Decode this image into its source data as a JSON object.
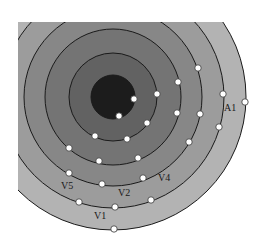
{
  "diagram": {
    "type": "concentric-rings",
    "center": {
      "x": 113,
      "y": 97
    },
    "clip": {
      "left": 18,
      "top": 22
    },
    "rings": [
      {
        "radius": 133,
        "color": "#b3b3b3"
      },
      {
        "radius": 111,
        "color": "#9c9c9c"
      },
      {
        "radius": 89,
        "color": "#878787"
      },
      {
        "radius": 68,
        "color": "#747474"
      },
      {
        "radius": 44,
        "color": "#626262"
      },
      {
        "radius": 22,
        "color": "#1c1c1c"
      }
    ],
    "nodes": [
      {
        "x": 134,
        "y": 99
      },
      {
        "x": 119,
        "y": 116
      },
      {
        "x": 157,
        "y": 94
      },
      {
        "x": 147,
        "y": 123
      },
      {
        "x": 95,
        "y": 136
      },
      {
        "x": 127,
        "y": 139
      },
      {
        "x": 178,
        "y": 82
      },
      {
        "x": 177,
        "y": 113
      },
      {
        "x": 69,
        "y": 148
      },
      {
        "x": 99,
        "y": 161
      },
      {
        "x": 138,
        "y": 158
      },
      {
        "x": 198,
        "y": 68
      },
      {
        "x": 200,
        "y": 114
      },
      {
        "x": 189,
        "y": 142
      },
      {
        "x": 69,
        "y": 173
      },
      {
        "x": 102,
        "y": 184
      },
      {
        "x": 143,
        "y": 178
      },
      {
        "x": 223,
        "y": 94
      },
      {
        "x": 219,
        "y": 127
      },
      {
        "x": 79,
        "y": 202
      },
      {
        "x": 115,
        "y": 207
      },
      {
        "x": 151,
        "y": 200
      },
      {
        "x": 245,
        "y": 102
      },
      {
        "x": 114,
        "y": 229
      }
    ],
    "labels": [
      {
        "id": "A1",
        "text": "A1",
        "x": 224,
        "y": 111
      },
      {
        "id": "V5",
        "text": "V5",
        "x": 61,
        "y": 189
      },
      {
        "id": "V2",
        "text": "V2",
        "x": 118,
        "y": 196
      },
      {
        "id": "V4",
        "text": "V4",
        "x": 158,
        "y": 181
      },
      {
        "id": "V1",
        "text": "V1",
        "x": 94,
        "y": 219
      }
    ]
  }
}
